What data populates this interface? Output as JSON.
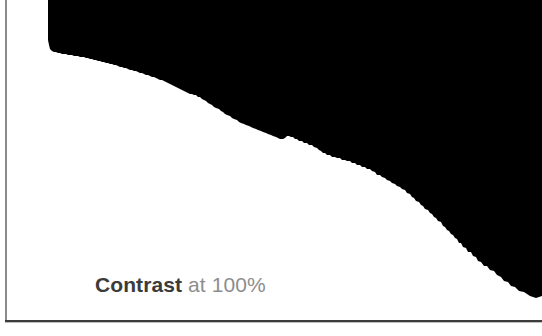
{
  "image_plate": {
    "name": "high-contrast-photo",
    "black_color": "#000000",
    "white_color": "#ffffff",
    "description": "Photograph rendered at maximum contrast: solid black upper-right region separated from solid white lower-left region by a rough jagged diagonal edge"
  },
  "caption": {
    "strong_text": "Contrast",
    "light_text": " at 100%",
    "full_text": "Contrast at 100%",
    "strong_color": "#3b3b3b",
    "light_color": "#8d8d8d",
    "value": "100%",
    "setting_name": "Contrast"
  },
  "frame": {
    "left_border_color": "#8a8a8a",
    "bottom_border_color": "#3c3c3c",
    "bottom_shadow_color": "#bdbdbd"
  }
}
